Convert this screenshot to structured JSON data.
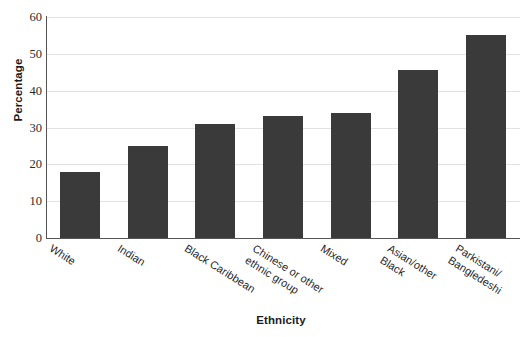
{
  "chart_data": {
    "type": "bar",
    "title": "",
    "xlabel": "Ethnicity",
    "ylabel": "Percentage",
    "categories": [
      "White",
      "Indian",
      "Black Caribbean",
      "Chinese or other ethnic group",
      "Mixed",
      "Asian/other Black",
      "Parkistani/ Bangledeshi"
    ],
    "category_lines": [
      [
        "White"
      ],
      [
        "Indian"
      ],
      [
        "Black Caribbean"
      ],
      [
        "Chinese or other",
        "ethnic group"
      ],
      [
        "Mixed"
      ],
      [
        "Asian/other",
        "Black"
      ],
      [
        "Parkistani/",
        "Bangledeshi"
      ]
    ],
    "values": [
      18,
      25,
      31,
      33,
      34,
      45.5,
      55
    ],
    "ylim": [
      0,
      60
    ],
    "ytick_values": [
      0,
      10,
      20,
      30,
      40,
      50,
      60
    ],
    "ytick_labels": [
      "0",
      "10",
      "20",
      "30",
      "40",
      "50",
      "60"
    ],
    "grid": true,
    "legend": false,
    "bar_color": "#3a3a3a",
    "grid_color": "#e2e2e2",
    "axis_color": "#555555",
    "background": "#ffffff"
  }
}
